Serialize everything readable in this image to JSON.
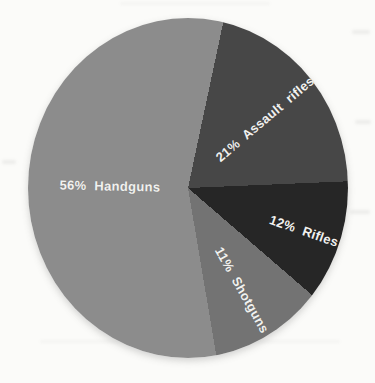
{
  "chart_data": {
    "type": "pie",
    "title": "",
    "legend": "none",
    "grid": false,
    "direction": "clockwise",
    "start_angle_deg": 12,
    "label_color": "#f1f1ef",
    "categories": [
      "Assault rifles",
      "Rifles",
      "Shotguns",
      "Handguns"
    ],
    "values": [
      21,
      12,
      11,
      56
    ],
    "slices": [
      {
        "label": "Assault rifles",
        "pct": 21,
        "display": "21% Assault rifles",
        "color": "#474747",
        "label_radius_frac": 0.63
      },
      {
        "label": "Rifles",
        "pct": 12,
        "display": "12% Rifles",
        "color": "#262626",
        "label_radius_frac": 0.77
      },
      {
        "label": "Shotguns",
        "pct": 11,
        "display": "11% Shotguns",
        "color": "#737373",
        "label_radius_frac": 0.69
      },
      {
        "label": "Handguns",
        "pct": 56,
        "display": "56% Handguns",
        "color": "#8c8c8c",
        "label_radius_frac": 0.49
      }
    ]
  }
}
